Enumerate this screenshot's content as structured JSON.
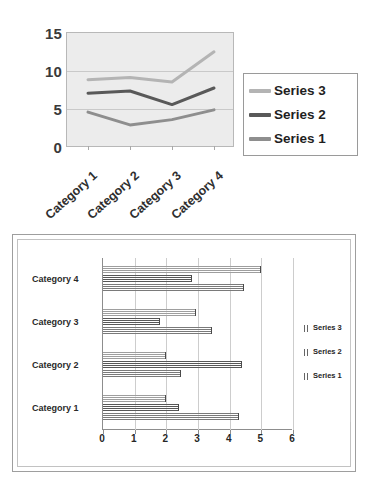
{
  "chart_data": [
    {
      "type": "line",
      "id": "line-chart",
      "title": "",
      "xlabel": "",
      "ylabel": "",
      "categories": [
        "Category 1",
        "Category 2",
        "Category 3",
        "Category 4"
      ],
      "series": [
        {
          "name": "Series 1",
          "values": [
            4.5,
            2.8,
            3.5,
            4.8
          ],
          "color": "#8e8e8e"
        },
        {
          "name": "Series 2",
          "values": [
            7.0,
            7.3,
            5.5,
            7.7
          ],
          "color": "#595959"
        },
        {
          "name": "Series 3",
          "values": [
            8.8,
            9.1,
            8.5,
            12.5
          ],
          "color": "#b4b4b4"
        }
      ],
      "ylim": [
        0,
        15
      ],
      "yticks": [
        0,
        5,
        10,
        15
      ],
      "ytick_labels": [
        "0",
        "5",
        "10",
        "15"
      ],
      "grid": "horizontal",
      "legend_position": "right",
      "legend_order": [
        "Series 3",
        "Series 2",
        "Series 1"
      ],
      "plot_background": "#ececec"
    },
    {
      "type": "bar",
      "id": "bar-chart",
      "orientation": "horizontal",
      "title": "",
      "xlabel": "",
      "ylabel": "",
      "categories": [
        "Category 1",
        "Category 2",
        "Category 3",
        "Category 4"
      ],
      "series": [
        {
          "name": "Series 1",
          "values": [
            4.3,
            2.45,
            3.45,
            4.45
          ],
          "color": "#7a7a7a"
        },
        {
          "name": "Series 2",
          "values": [
            2.4,
            4.4,
            1.8,
            2.8
          ],
          "color": "#575757"
        },
        {
          "name": "Series 3",
          "values": [
            2.0,
            2.0,
            2.95,
            5.0
          ],
          "color": "#9e9e9e"
        }
      ],
      "xlim": [
        0,
        6
      ],
      "xticks": [
        0,
        1,
        2,
        3,
        4,
        5,
        6
      ],
      "xtick_labels": [
        "0",
        "1",
        "2",
        "3",
        "4",
        "5",
        "6"
      ],
      "grid": "vertical",
      "legend_position": "right",
      "legend_order": [
        "Series 3",
        "Series 2",
        "Series 1"
      ],
      "plot_background": "#ffffff"
    }
  ],
  "line_chart": {
    "y_tick_labels": [
      "15",
      "10",
      "5",
      "0"
    ],
    "category_labels": [
      "Category 1",
      "Category 2",
      "Category 3",
      "Category 4"
    ],
    "legend": [
      {
        "label": "Series 3",
        "color": "#b4b4b4"
      },
      {
        "label": "Series 2",
        "color": "#595959"
      },
      {
        "label": "Series 1",
        "color": "#8e8e8e"
      }
    ]
  },
  "bar_chart": {
    "x_tick_labels": [
      "0",
      "1",
      "2",
      "3",
      "4",
      "5",
      "6"
    ],
    "category_labels": [
      "Category 4",
      "Category 3",
      "Category 2",
      "Category 1"
    ],
    "legend": [
      {
        "label": "Series 3",
        "color": "#9e9e9e"
      },
      {
        "label": "Series 2",
        "color": "#575757"
      },
      {
        "label": "Series 1",
        "color": "#7a7a7a"
      }
    ]
  }
}
